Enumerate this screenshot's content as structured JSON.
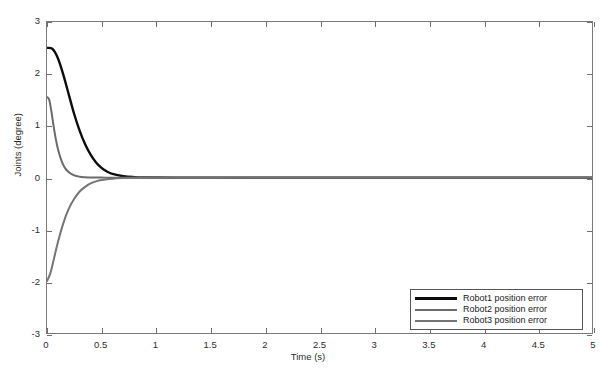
{
  "chart_data": {
    "type": "line",
    "title": "",
    "xlabel": "Time (s)",
    "ylabel": "Joints (degree)",
    "xlim": [
      0,
      5
    ],
    "ylim": [
      -3,
      3
    ],
    "xticks": [
      0,
      0.5,
      1,
      1.5,
      2,
      2.5,
      3,
      3.5,
      4,
      4.5,
      5
    ],
    "xtick_labels": [
      "0",
      "0.5",
      "1",
      "1.5",
      "2",
      "2.5",
      "3",
      "3.5",
      "4",
      "4.5",
      "5"
    ],
    "yticks": [
      -3,
      -2,
      -1,
      0,
      1,
      2,
      3
    ],
    "ytick_labels": [
      "-3",
      "-2",
      "-1",
      "0",
      "1",
      "2",
      "3"
    ],
    "grid": false,
    "legend_position": "lower right",
    "series": [
      {
        "name": "Robot1 position error",
        "color": "#0d0d0d",
        "x": [
          0,
          0.05,
          0.1,
          0.15,
          0.2,
          0.25,
          0.3,
          0.35,
          0.4,
          0.45,
          0.5,
          0.55,
          0.6,
          0.7,
          0.8,
          0.9,
          1.0,
          1.25,
          1.5,
          2.0,
          2.5,
          3.0,
          3.5,
          4.0,
          4.5,
          5.0
        ],
        "values": [
          2.5,
          2.48,
          2.3,
          1.98,
          1.6,
          1.22,
          0.9,
          0.64,
          0.44,
          0.29,
          0.185,
          0.115,
          0.07,
          0.025,
          0.008,
          0.002,
          0.0,
          -0.002,
          -0.003,
          -0.004,
          -0.004,
          -0.004,
          -0.004,
          -0.004,
          -0.004,
          -0.004
        ]
      },
      {
        "name": "Robot2 position error",
        "color": "#6b6b6b",
        "x": [
          0,
          0.02,
          0.04,
          0.06,
          0.08,
          0.1,
          0.13,
          0.16,
          0.2,
          0.25,
          0.3,
          0.35,
          0.4,
          0.5,
          0.6,
          0.8,
          1.0,
          1.5,
          2.0,
          2.5,
          3.0,
          3.5,
          4.0,
          4.5,
          5.0
        ],
        "values": [
          1.55,
          1.5,
          1.28,
          1.0,
          0.75,
          0.55,
          0.34,
          0.2,
          0.1,
          0.04,
          0.015,
          0.005,
          0.0,
          -0.002,
          -0.003,
          -0.004,
          -0.004,
          -0.005,
          -0.005,
          -0.005,
          -0.005,
          -0.005,
          -0.005,
          -0.005,
          -0.005
        ]
      },
      {
        "name": "Robot3 position error",
        "color": "#757575",
        "x": [
          0,
          0.03,
          0.06,
          0.1,
          0.15,
          0.2,
          0.25,
          0.3,
          0.35,
          0.4,
          0.45,
          0.5,
          0.6,
          0.7,
          0.8,
          1.0,
          1.25,
          1.5,
          2.0,
          2.5,
          3.0,
          3.5,
          4.0,
          4.5,
          5.0
        ],
        "values": [
          -2.0,
          -1.85,
          -1.6,
          -1.25,
          -0.88,
          -0.6,
          -0.41,
          -0.27,
          -0.18,
          -0.115,
          -0.075,
          -0.05,
          -0.022,
          -0.01,
          -0.005,
          -0.002,
          -0.001,
          0.0,
          0.0,
          0.0,
          0.0,
          0.0,
          0.0,
          0.0,
          0.0
        ]
      }
    ]
  },
  "legend": {
    "entries": [
      {
        "label": "Robot1 position error"
      },
      {
        "label": "Robot2 position error"
      },
      {
        "label": "Robot3 position error"
      }
    ]
  }
}
